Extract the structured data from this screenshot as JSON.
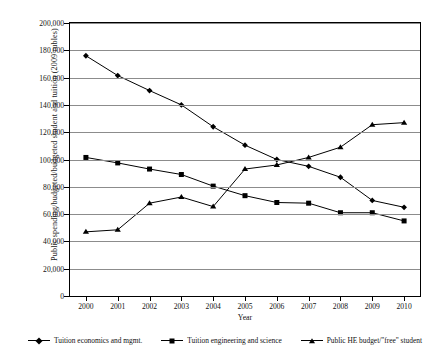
{
  "chart_data": {
    "type": "line",
    "title": "",
    "xlabel": "Year",
    "ylabel": "Public spending/budgeted/budgeted student and tuition (2009 rubles)",
    "categories": [
      "2000",
      "2001",
      "2002",
      "2003",
      "2004",
      "2005",
      "2006",
      "2007",
      "2008",
      "2009",
      "2010"
    ],
    "ylim": [
      0,
      200000
    ],
    "ytick_labels": [
      "0",
      "20,000",
      "40,000",
      "60,000",
      "80,000",
      "100,000",
      "120,000",
      "140,000",
      "160,000",
      "180,000",
      "200,000"
    ],
    "ytick_values": [
      0,
      20000,
      40000,
      60000,
      80000,
      100000,
      120000,
      140000,
      160000,
      180000,
      200000
    ],
    "grid": true,
    "legend_position": "bottom",
    "series": [
      {
        "name": "Tuition economics and mgmt.",
        "marker": "diamond",
        "values": [
          176000,
          161500,
          150500,
          140000,
          124000,
          110500,
          100000,
          95000,
          87000,
          70000,
          65000
        ]
      },
      {
        "name": "Tuition engineering and science",
        "marker": "square",
        "values": [
          101500,
          97500,
          93000,
          89000,
          80500,
          73500,
          68500,
          68000,
          61000,
          61000,
          55000
        ]
      },
      {
        "name": "Public HE budget/\"free\" student",
        "marker": "triangle",
        "values": [
          47000,
          48500,
          68000,
          72500,
          65500,
          93000,
          96000,
          101500,
          109000,
          125500,
          127000
        ]
      }
    ],
    "colors": {
      "series_line": "#000000",
      "gridline": "#8c8c8c",
      "axis": "#000000",
      "background": "#ffffff"
    }
  },
  "axis": {
    "x_title": "Year",
    "y_title": "Public spending/budgeted/budgeted student and tuition (2009 rubles)"
  },
  "legend": {
    "items": [
      {
        "label": "Tuition economics and mgmt.",
        "marker": "diamond-marker-icon"
      },
      {
        "label": "Tuition engineering and science",
        "marker": "square-marker-icon"
      },
      {
        "label": "Public HE budget/\"free\" student",
        "marker": "triangle-marker-icon"
      }
    ]
  }
}
